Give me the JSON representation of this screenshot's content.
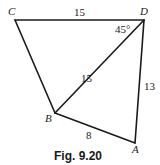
{
  "figure": {
    "caption": "Fig. 9.20",
    "vertices": {
      "A": {
        "label": "A",
        "x": 135,
        "y": 143
      },
      "B": {
        "label": "B",
        "x": 55,
        "y": 113
      },
      "C": {
        "label": "C",
        "x": 15,
        "y": 20
      },
      "D": {
        "label": "D",
        "x": 144,
        "y": 20
      }
    },
    "edges": [
      {
        "from": "C",
        "to": "D",
        "length_label": "15"
      },
      {
        "from": "D",
        "to": "B",
        "length_label": "15"
      },
      {
        "from": "D",
        "to": "A",
        "length_label": "13"
      },
      {
        "from": "B",
        "to": "A",
        "length_label": "8"
      },
      {
        "from": "C",
        "to": "B",
        "length_label": ""
      }
    ],
    "angle_label": "45°",
    "colors": {
      "stroke": "#1a1a1a",
      "background": "#ffffff"
    }
  }
}
